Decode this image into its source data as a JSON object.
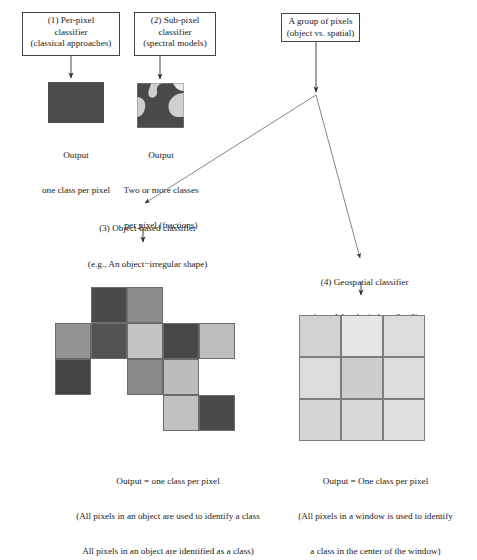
{
  "figure": {
    "background": "#ffffff",
    "line_color": "#555555",
    "text_color": "#1a1a1a"
  },
  "nodes": {
    "per_pixel": {
      "id": "1",
      "line1": "(1) Per-pixel",
      "line2": "classifier",
      "line3": "(classical approaches)",
      "x": 22,
      "y": 12,
      "w": 98,
      "h": 42
    },
    "sub_pixel": {
      "id": "2",
      "line1": "(2) Sub-pixel",
      "line2": "classifier",
      "line3": "(spectral models)",
      "x": 135,
      "y": 12,
      "w": 80,
      "h": 42
    },
    "group_of_pixels": {
      "line1": "A group of pixels",
      "line2": "(object vs. spatial)",
      "x": 281,
      "y": 13,
      "w": 78,
      "h": 28
    },
    "object_based": {
      "label": "(3) Object-based classifier",
      "x": 113,
      "y": 216
    },
    "geospatial": {
      "label": "(4) Geospatial classifier",
      "x": 356,
      "y": 271
    }
  },
  "outputs": {
    "per_pixel": {
      "line1": "Output",
      "line2": "one class per pixel",
      "swatch_color": "#4d4d4d",
      "x": 48,
      "y": 82,
      "w": 55,
      "h": 40
    },
    "sub_pixel": {
      "line1": "Output",
      "line2": "Two or more classes",
      "line3": "per pixel (fractions)",
      "x": 137,
      "y": 83,
      "w": 46,
      "h": 44,
      "bg_color": "#cfcfcf",
      "fg_color": "#4a4a4a"
    }
  },
  "examples": {
    "object": "(e.g., An object−irregular shape)",
    "window": "(e.g., A local window -3 × 3)"
  },
  "object_grid": {
    "cell": 36,
    "origin_x": 55,
    "origin_y": 287,
    "cells": [
      {
        "col": 1,
        "row": 0,
        "color": "#4a4a4a"
      },
      {
        "col": 2,
        "row": 0,
        "color": "#8c8c8c"
      },
      {
        "col": 0,
        "row": 1,
        "color": "#949494"
      },
      {
        "col": 1,
        "row": 1,
        "color": "#535353"
      },
      {
        "col": 2,
        "row": 1,
        "color": "#c3c3c3"
      },
      {
        "col": 3,
        "row": 1,
        "color": "#474747"
      },
      {
        "col": 4,
        "row": 1,
        "color": "#bdbdbd"
      },
      {
        "col": 0,
        "row": 2,
        "color": "#444444"
      },
      {
        "col": 2,
        "row": 2,
        "color": "#898989"
      },
      {
        "col": 3,
        "row": 2,
        "color": "#bcbcbc"
      },
      {
        "col": 3,
        "row": 3,
        "color": "#c1c1c1"
      },
      {
        "col": 4,
        "row": 3,
        "color": "#4a4a4a"
      }
    ]
  },
  "window_grid": {
    "cell": 42,
    "origin_x": 299,
    "origin_y": 315,
    "cells": [
      {
        "col": 0,
        "row": 0,
        "color": "#d2d2d2"
      },
      {
        "col": 1,
        "row": 0,
        "color": "#e6e6e6"
      },
      {
        "col": 2,
        "row": 0,
        "color": "#dcdcdc"
      },
      {
        "col": 0,
        "row": 1,
        "color": "#dcdcdc"
      },
      {
        "col": 1,
        "row": 1,
        "color": "#cdcdcd"
      },
      {
        "col": 2,
        "row": 1,
        "color": "#dddddd"
      },
      {
        "col": 0,
        "row": 2,
        "color": "#d6d6d6"
      },
      {
        "col": 1,
        "row": 2,
        "color": "#d8d8d8"
      },
      {
        "col": 2,
        "row": 2,
        "color": "#e2e2e2"
      }
    ]
  },
  "bottom_captions": {
    "object": {
      "line1": "Output = one class per pixel",
      "line2": "(All pixels in an object are used to identify a class",
      "line3": "All pixels in an object are identified as a class)",
      "x": 168,
      "y": 455
    },
    "window": {
      "line1": "Output = One class per pixel",
      "line2": "(All pixels in a window is used to identify",
      "line3": "a class in the center of the window)",
      "x": 375,
      "y": 455
    }
  }
}
